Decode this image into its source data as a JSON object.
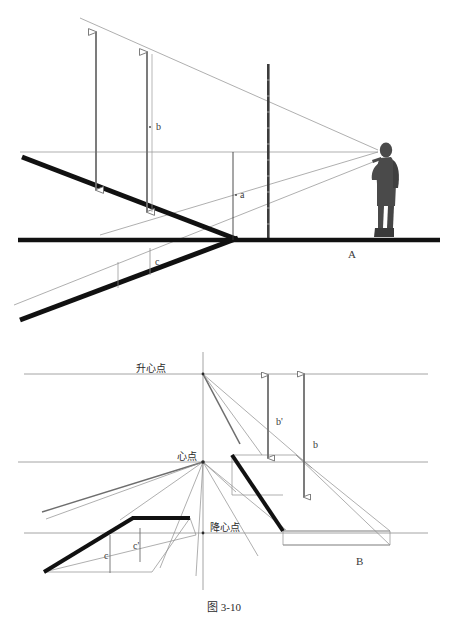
{
  "figure": {
    "caption": "图 3-10",
    "panels": [
      {
        "id": "A",
        "label": "A"
      },
      {
        "id": "B",
        "label": "B"
      }
    ]
  },
  "panel_a": {
    "name": "upper-elevation-view",
    "dimension_labels": [
      {
        "key": "a",
        "text": "a",
        "x": 243,
        "y": 195
      },
      {
        "key": "b",
        "text": "b",
        "x": 157,
        "y": 127
      },
      {
        "key": "c",
        "text": "c",
        "x": 155,
        "y": 262
      }
    ],
    "panel_label": "A",
    "observer": {
      "name": "observer-figure",
      "description": "standing person holding drawing board"
    },
    "horizon_line_y": 152,
    "ground_line_y": 240,
    "vanishing_point": {
      "x": 378,
      "y": 152
    }
  },
  "panel_b": {
    "name": "lower-perspective-construction",
    "points": [
      {
        "key": "rising_center",
        "text": "升心点",
        "x": 166,
        "y": 372
      },
      {
        "key": "center",
        "text": "心点",
        "x": 174,
        "y": 460
      },
      {
        "key": "falling_center",
        "text": "降心点",
        "x": 206,
        "y": 531
      }
    ],
    "dimension_labels": [
      {
        "key": "b_prime",
        "text": "b'",
        "x": 277,
        "y": 422
      },
      {
        "key": "b",
        "text": "b",
        "x": 315,
        "y": 445
      },
      {
        "key": "c",
        "text": "c",
        "x": 107,
        "y": 557
      },
      {
        "key": "c_prime",
        "text": "c'",
        "x": 136,
        "y": 547
      }
    ],
    "panel_label": "B",
    "horizontal_lines_y": [
      374,
      462,
      533
    ],
    "axis_x": 203
  },
  "colors": {
    "ink_black": "#111111",
    "thin_line": "#8d8d8d",
    "mid_line": "#6e6e6e",
    "text": "#2b2b2b",
    "figure_gray": "#4a4a4a",
    "background": "#ffffff"
  }
}
